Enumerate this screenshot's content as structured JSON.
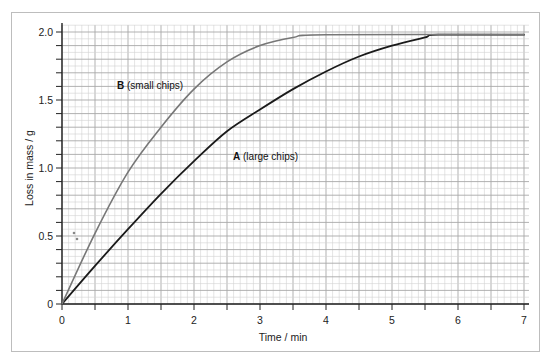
{
  "chart_data": {
    "type": "line",
    "title": "",
    "xlabel": "Time / min",
    "ylabel": "Loss in mass / g",
    "xlim": [
      0,
      7
    ],
    "ylim": [
      0,
      2.0
    ],
    "x_ticks": [
      "0",
      "1",
      "2",
      "3",
      "4",
      "5",
      "6",
      "7"
    ],
    "y_ticks": [
      "0",
      "0.5",
      "1.0",
      "1.5",
      "2.0"
    ],
    "grid": true,
    "legend": "inline labels",
    "series": [
      {
        "name": "A (large chips)",
        "key": "A",
        "desc": "(large chips)",
        "color": "#1a1a1a",
        "x": [
          0,
          0.5,
          1,
          1.5,
          2,
          2.5,
          3,
          3.5,
          4,
          4.5,
          5,
          5.5,
          5.7,
          7
        ],
        "values": [
          0,
          0.28,
          0.55,
          0.81,
          1.05,
          1.27,
          1.43,
          1.58,
          1.71,
          1.82,
          1.9,
          1.96,
          1.98,
          1.98
        ]
      },
      {
        "name": "B (small chips)",
        "key": "B",
        "desc": "(small chips)",
        "color": "#777777",
        "x": [
          0,
          0.5,
          1,
          1.5,
          2,
          2.5,
          3,
          3.5,
          4,
          7
        ],
        "values": [
          0,
          0.52,
          0.97,
          1.3,
          1.58,
          1.78,
          1.9,
          1.96,
          1.98,
          1.98
        ]
      }
    ]
  },
  "labels": {
    "xlabel": "Time / min",
    "ylabel": "Loss in mass / g",
    "series_a_key": "A",
    "series_a_desc": " (large chips)",
    "series_b_key": "B",
    "series_b_desc": " (small chips)"
  },
  "colors": {
    "grid_major": "#a8a8a8",
    "grid_minor": "#d2d2d2",
    "axis": "#222222",
    "frame": "#bdbdbd"
  }
}
